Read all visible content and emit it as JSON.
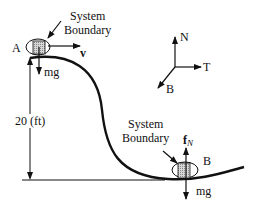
{
  "diagram": {
    "point_a": {
      "label": "A",
      "boundary_label_line1": "System",
      "boundary_label_line2": "Boundary",
      "velocity_label": "v",
      "weight_label": "mg"
    },
    "point_b": {
      "label": "B",
      "boundary_label_line1": "System",
      "boundary_label_line2": "Boundary",
      "normal_force_label": "f",
      "normal_force_subscript": "N",
      "weight_label": "mg"
    },
    "height_label": "20 (ft)",
    "axes": {
      "n_label": "N",
      "t_label": "T",
      "b_label": "B"
    },
    "colors": {
      "line": "#111111",
      "block_fill": "#bdbdbd"
    }
  }
}
